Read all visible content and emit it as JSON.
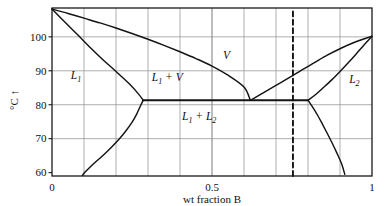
{
  "chart_data": {
    "type": "line",
    "title": "",
    "xlabel": "wt fraction B",
    "ylabel": "°C",
    "ylabel_arrow": "↑",
    "xlim": [
      0,
      1
    ],
    "ylim": [
      59,
      108.5
    ],
    "grid": true,
    "legend": "none",
    "x_ticks": [
      {
        "value": 0,
        "label": "0"
      },
      {
        "value": 0.5,
        "label": "0.5"
      },
      {
        "value": 1,
        "label": "1"
      }
    ],
    "x_gridlines": [
      0.1,
      0.2,
      0.3,
      0.4,
      0.5,
      0.6,
      0.7,
      0.8,
      0.9
    ],
    "y_ticks": [
      {
        "value": 60,
        "label": "60"
      },
      {
        "value": 70,
        "label": "70"
      },
      {
        "value": 80,
        "label": "80"
      },
      {
        "value": 90,
        "label": "90"
      },
      {
        "value": 100,
        "label": "100"
      }
    ],
    "y_gridlines": [
      70,
      80,
      90,
      100
    ],
    "annotations": [
      {
        "name": "region-L1",
        "text": "L",
        "subscript": "1",
        "x": 0.075,
        "y": 87.5
      },
      {
        "name": "region-L1-plus-V",
        "text": "L",
        "subscript": "1",
        "text2": " + V",
        "x": 0.36,
        "y": 87.0
      },
      {
        "name": "region-V",
        "text": "V",
        "x": 0.545,
        "y": 93.5
      },
      {
        "name": "region-L1-plus-L2",
        "text": "L",
        "subscript": "1",
        "text2": " + L",
        "subscript2": "2",
        "x": 0.46,
        "y": 75.5
      },
      {
        "name": "region-L2",
        "text": "L",
        "subscript": "2",
        "x": 0.945,
        "y": 86.5
      }
    ],
    "series": [
      {
        "name": "vapor-curve-left",
        "style": "solid",
        "points": [
          [
            0.0,
            108.2
          ],
          [
            0.05,
            106.9
          ],
          [
            0.1,
            105.5
          ],
          [
            0.15,
            104.1
          ],
          [
            0.2,
            102.6
          ],
          [
            0.25,
            101.0
          ],
          [
            0.3,
            99.3
          ],
          [
            0.35,
            97.5
          ],
          [
            0.4,
            95.6
          ],
          [
            0.45,
            93.6
          ],
          [
            0.5,
            91.4
          ],
          [
            0.55,
            88.7
          ],
          [
            0.6,
            85.2
          ],
          [
            0.62,
            81.3
          ]
        ]
      },
      {
        "name": "liquidus-L1-branch",
        "style": "solid",
        "points": [
          [
            0.0,
            108.2
          ],
          [
            0.04,
            104.4
          ],
          [
            0.08,
            100.6
          ],
          [
            0.12,
            96.8
          ],
          [
            0.16,
            93.2
          ],
          [
            0.2,
            89.8
          ],
          [
            0.24,
            86.3
          ],
          [
            0.27,
            83.2
          ],
          [
            0.285,
            81.3
          ]
        ]
      },
      {
        "name": "vapor-curve-right",
        "style": "solid",
        "points": [
          [
            0.62,
            81.3
          ],
          [
            0.66,
            83.5
          ],
          [
            0.7,
            85.7
          ],
          [
            0.74,
            87.9
          ],
          [
            0.78,
            90.2
          ],
          [
            0.82,
            92.4
          ],
          [
            0.86,
            94.6
          ],
          [
            0.9,
            96.5
          ],
          [
            0.94,
            98.2
          ],
          [
            1.0,
            100.2
          ]
        ]
      },
      {
        "name": "liquidus-L2-branch",
        "style": "solid",
        "points": [
          [
            0.8,
            81.3
          ],
          [
            0.825,
            83.1
          ],
          [
            0.85,
            85.2
          ],
          [
            0.875,
            87.4
          ],
          [
            0.9,
            89.8
          ],
          [
            0.925,
            92.3
          ],
          [
            0.95,
            94.9
          ],
          [
            0.975,
            97.6
          ],
          [
            1.0,
            100.2
          ]
        ]
      },
      {
        "name": "solubility-curve-left",
        "style": "solid",
        "points": [
          [
            0.285,
            81.3
          ],
          [
            0.275,
            79.4
          ],
          [
            0.265,
            77.3
          ],
          [
            0.25,
            74.8
          ],
          [
            0.23,
            72.2
          ],
          [
            0.21,
            69.9
          ],
          [
            0.185,
            67.4
          ],
          [
            0.16,
            65.1
          ],
          [
            0.13,
            62.6
          ],
          [
            0.105,
            60.3
          ],
          [
            0.095,
            59.2
          ]
        ]
      },
      {
        "name": "solubility-curve-right",
        "style": "solid",
        "points": [
          [
            0.8,
            81.3
          ],
          [
            0.815,
            79.2
          ],
          [
            0.83,
            76.9
          ],
          [
            0.845,
            74.3
          ],
          [
            0.86,
            71.6
          ],
          [
            0.875,
            68.8
          ],
          [
            0.89,
            65.8
          ],
          [
            0.905,
            62.6
          ],
          [
            0.915,
            59.5
          ]
        ]
      },
      {
        "name": "three-phase-tie-line",
        "style": "solid-thick",
        "points": [
          [
            0.285,
            81.3
          ],
          [
            0.8,
            81.3
          ]
        ]
      },
      {
        "name": "composition-dashed-line",
        "style": "dashed",
        "points": [
          [
            0.753,
            59
          ],
          [
            0.753,
            108.5
          ]
        ]
      }
    ]
  }
}
